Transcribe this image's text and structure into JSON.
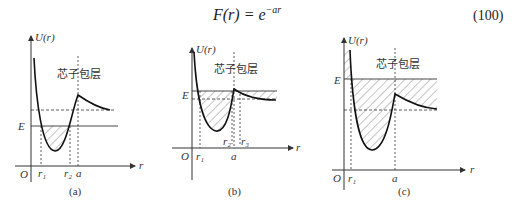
{
  "equation": {
    "lhs": "F(r) = e",
    "exponent": "−ar",
    "number": "(100)"
  },
  "figures": [
    {
      "label": "(a)",
      "y_axis": "U(r)",
      "x_axis": "r",
      "origin": "O",
      "energy": "E",
      "region": "芯子包层",
      "ticks": [
        "r₁",
        "r₂",
        "a"
      ]
    },
    {
      "label": "(b)",
      "y_axis": "U(r)",
      "x_axis": "r",
      "origin": "O",
      "energy": "E",
      "region": "芯子包层",
      "ticks": [
        "r₁",
        "r₂",
        "a",
        "r₃"
      ]
    },
    {
      "label": "(c)",
      "y_axis": "U(r)",
      "x_axis": "r",
      "origin": "O",
      "energy": "E",
      "region": "芯子包层",
      "ticks": [
        "r₁",
        "a"
      ]
    }
  ]
}
